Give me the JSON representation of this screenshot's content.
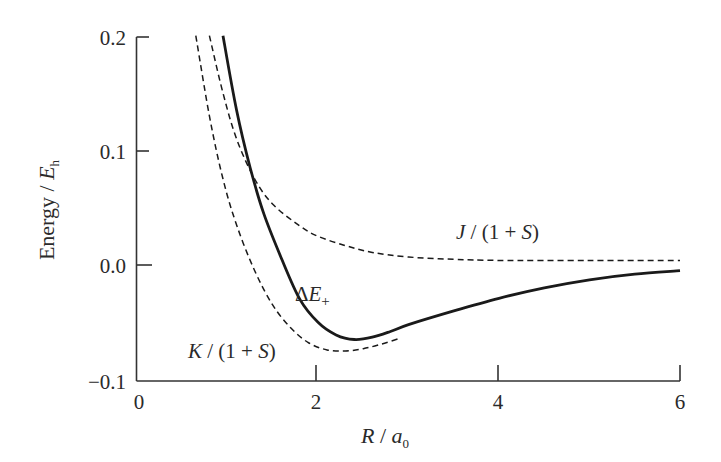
{
  "chart_data": {
    "type": "line",
    "title": "",
    "xlabel": "R / a0",
    "ylabel": "Energy / Eh",
    "xlim": [
      0,
      6
    ],
    "ylim": [
      -0.1,
      0.2
    ],
    "xticks": [
      0,
      2,
      4,
      6
    ],
    "xtick_labels": [
      "0",
      "2",
      "4",
      "6"
    ],
    "yticks": [
      -0.1,
      0.0,
      0.1,
      0.2
    ],
    "ytick_labels": [
      "−0.1",
      "0.0",
      "0.1",
      "0.2"
    ],
    "grid": false,
    "legend": "none (inline annotations)",
    "series": [
      {
        "name": "ΔE+",
        "style": "solid",
        "x": [
          0.95,
          1.1,
          1.25,
          1.4,
          1.6,
          1.8,
          2.0,
          2.2,
          2.4,
          2.6,
          2.8,
          3.0,
          3.5,
          4.0,
          4.5,
          5.0,
          5.5,
          6.0
        ],
        "y": [
          0.2,
          0.135,
          0.085,
          0.045,
          0.005,
          -0.03,
          -0.05,
          -0.061,
          -0.065,
          -0.063,
          -0.058,
          -0.052,
          -0.04,
          -0.029,
          -0.02,
          -0.013,
          -0.008,
          -0.005
        ]
      },
      {
        "name": "J/(1+S)",
        "style": "dashed",
        "x": [
          0.8,
          0.95,
          1.1,
          1.3,
          1.5,
          1.8,
          2.0,
          2.3,
          2.6,
          3.0,
          3.5,
          4.0,
          5.0,
          6.0
        ],
        "y": [
          0.2,
          0.15,
          0.11,
          0.075,
          0.053,
          0.034,
          0.025,
          0.017,
          0.011,
          0.007,
          0.005,
          0.004,
          0.004,
          0.004
        ]
      },
      {
        "name": "K/(1+S)",
        "style": "dashed",
        "x": [
          0.65,
          0.8,
          0.95,
          1.1,
          1.3,
          1.5,
          1.7,
          1.9,
          2.1,
          2.3,
          2.5,
          2.7,
          2.9
        ],
        "y": [
          0.2,
          0.13,
          0.075,
          0.035,
          -0.005,
          -0.035,
          -0.055,
          -0.068,
          -0.074,
          -0.075,
          -0.073,
          -0.069,
          -0.064
        ]
      }
    ],
    "annotations": [
      {
        "text": "J/(1+S)",
        "x": 3.55,
        "y": 0.028
      },
      {
        "text": "ΔE+",
        "x": 1.85,
        "y": -0.025
      },
      {
        "text": "K/(1+S)",
        "x": 0.55,
        "y": -0.08
      }
    ]
  },
  "labels": {
    "y_axis_title_main": "Energy",
    "y_axis_title_sep": " / ",
    "y_axis_title_var": "E",
    "y_axis_title_sub": "h",
    "x_axis_title_var": "R",
    "x_axis_title_sep": " / ",
    "x_axis_title_a": "a",
    "x_axis_title_sub": "0",
    "x_ticks": [
      "0",
      "2",
      "4",
      "6"
    ],
    "y_ticks": [
      "0.2",
      "0.1",
      "0.0",
      "−0.1"
    ],
    "annot_J_var": "J",
    "annot_J_rest": " / (1 + ",
    "annot_J_S": "S",
    "annot_J_close": ")",
    "annot_K_var": "K",
    "annot_K_rest": " / (1 + ",
    "annot_K_S": "S",
    "annot_K_close": ")",
    "annot_dE_delta": "Δ",
    "annot_dE_var": "E",
    "annot_dE_sub": "+"
  }
}
